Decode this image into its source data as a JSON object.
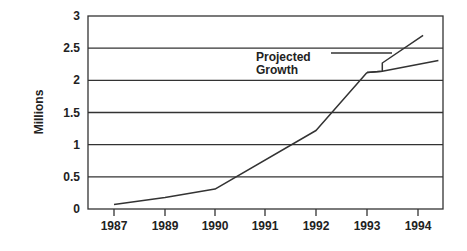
{
  "chart_data": {
    "type": "line",
    "title": "",
    "xlabel": "",
    "ylabel": "Millions",
    "ylim": [
      0,
      3
    ],
    "yticks": [
      0,
      0.5,
      1,
      1.5,
      2,
      2.5,
      3
    ],
    "ytick_labels": [
      "0",
      "0.5",
      "1",
      "1.5",
      "2",
      "2.5",
      "3"
    ],
    "xticks": [
      "1987",
      "1989",
      "1990",
      "1991",
      "1992",
      "1993",
      "1994"
    ],
    "grid": true,
    "legend": null,
    "series": [
      {
        "name": "Actual",
        "x": [
          "1987",
          "1989",
          "1990",
          "1992",
          "1993"
        ],
        "values": [
          0.07,
          0.18,
          0.31,
          1.22,
          2.12
        ]
      },
      {
        "name": "Projected Growth (high)",
        "x": [
          "1993",
          "1993.3",
          "1993.3",
          "1994.1"
        ],
        "values": [
          2.12,
          2.14,
          2.27,
          2.7
        ]
      },
      {
        "name": "Projected Growth (low)",
        "x": [
          "1993",
          "1993.3",
          "1994.4"
        ],
        "values": [
          2.12,
          2.14,
          2.31
        ]
      }
    ],
    "annotations": [
      {
        "text_lines": [
          "Projected",
          "Growth"
        ],
        "points_to": "projected branches",
        "x": "1993.3",
        "y": 2.42
      }
    ]
  }
}
